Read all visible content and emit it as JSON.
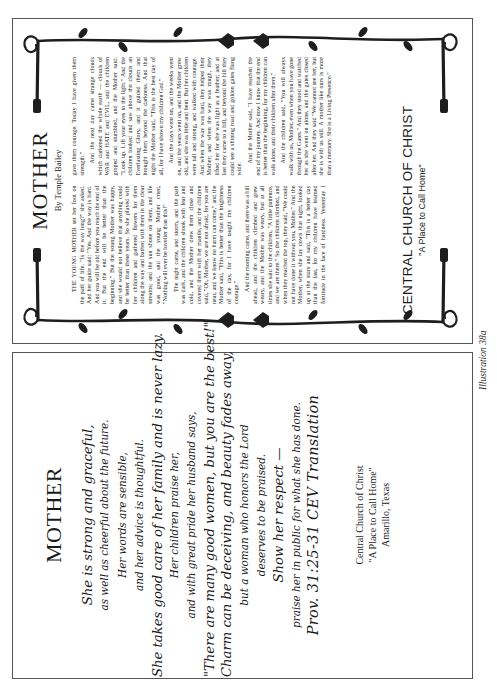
{
  "caption": "Illustration 38a",
  "bulletin_front": {
    "title": "MOTHER",
    "byline": "By Temple Bailey",
    "paragraphs": [
      "THE YOUNG MOTHER set her foot on the path of life. \"Is the way long?\" she asked. And her guide said: \"Yes. And the way is hard. And you will be old before you reach the end of it. But the end will be better than the beginning.\" But the young Mother was happy, and she would not believe that anything could be better than these years. So she played with her children and gathered flowers for them along the way and bathed with them in the clear streams; and the sun shone on them, and life was good, and the young Mother cried, \"Nothing will ever be lovelier than this!\"",
      "The night came, and storm, and the path was dark, and the children shook with fear and cold, and the Mother drew them close and covered them with her mantle, and the children said, \"Oh, Mother, we are not afraid, for you are near, and we know no harm can come,\" and the Mother said, \"This is better than the brightness of the day, for I have taught my children courage.\"",
      "And the morning came, and there was a hill ahead, and the children climbed and grew weary, and the Mother was weary, but at all times she said to the children, \"A little patience, and we are there.\" So the children climbed, and when they reached the top, they said, \"We could not have done it without you, Mother.\" And the Mother, when she lay down that night, looked up at the stars and said, \"This is a better day than the last, for my children have learned fortitude in the face of hardness. Yesterday I gave them courage. Today I have given them strength.\"",
      "And the next day came strange clouds which darkened the whole earth — clouds of WAR and HATE and EVIL, and the children groped and stumbled, and the Mother said: \"Look up. Lift your eyes to the light.\" And the children looked and saw above the clouds an Everlasting Glory, and it guided them and brought them beyond the darkness. And that night the Mother said, \"This is the best day of all, for I have shown my children God.\"",
      "And the days went on, and the weeks went on, and the years went on, and the Mother grew old, and she was little and bent. But her children were tall and strong, and walked with courage. And when the way was hard, they helped their Mother; and when the way was rough, they lifted her for she was light as a feather; and at last they came to a hill, and beyond the hill they could see a shining road and golden gates flung wide.",
      "And the Mother said, \"I have reached the end of my journey. And now I know that the end is better than the beginning, for my children can walk alone, and their children after them.\"",
      "And the children said, \"You will always walk with us, Mother, even when you have gone through the Gates.\" And they stood and watched her as she went on alone, and the gates closed after her. And they said \"We cannot see her, but she is with us still. A mother like ours is more than a memory. She is a Living Presence.\""
    ],
    "church_name": "CENTRAL CHURCH OF CHRIST",
    "church_tagline": "\"A Place to Call Home\""
  },
  "bulletin_back": {
    "title": "MOTHER",
    "poem_lines": [
      "She is strong and graceful,",
      "as well as cheerful about the future.",
      "Her words are sensible,",
      "and her advice is thoughtful.",
      "She takes good care of her family and is never lazy.",
      "Her children praise her,",
      "and with great pride her husband says,",
      "\"There are many good women, but you are the best!\"",
      "Charm can be deceiving, and beauty fades away,",
      "but a woman who honors the Lord",
      "deserves to be praised.",
      "Show her respect —",
      "praise her in public for what she has done."
    ],
    "verse_ref": "Prov. 31:25-31 CEV Translation",
    "church_name": "Central Church of Christ",
    "church_tagline": "\"A Place to Call Home\"",
    "church_location": "Amarillo, Texas"
  },
  "colors": {
    "ink": "#1a1a1a",
    "border": "#555555",
    "paper": "#ffffff"
  }
}
